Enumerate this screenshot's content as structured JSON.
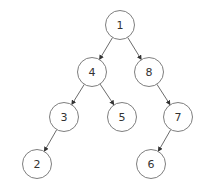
{
  "diagram": {
    "type": "binary-tree",
    "nodes": [
      {
        "id": "1",
        "label": "1",
        "x": 120,
        "y": 25
      },
      {
        "id": "4",
        "label": "4",
        "x": 92,
        "y": 72
      },
      {
        "id": "8",
        "label": "8",
        "x": 149,
        "y": 72
      },
      {
        "id": "3",
        "label": "3",
        "x": 64,
        "y": 117
      },
      {
        "id": "5",
        "label": "5",
        "x": 122,
        "y": 117
      },
      {
        "id": "7",
        "label": "7",
        "x": 178,
        "y": 117
      },
      {
        "id": "2",
        "label": "2",
        "x": 37,
        "y": 164
      },
      {
        "id": "6",
        "label": "6",
        "x": 151,
        "y": 164
      }
    ],
    "edges": [
      {
        "from": "1",
        "to": "4"
      },
      {
        "from": "1",
        "to": "8"
      },
      {
        "from": "4",
        "to": "3"
      },
      {
        "from": "4",
        "to": "5"
      },
      {
        "from": "8",
        "to": "7"
      },
      {
        "from": "3",
        "to": "2"
      },
      {
        "from": "7",
        "to": "6"
      }
    ],
    "node_radius": 14.5,
    "colors": {
      "stroke": "#6f6f6f",
      "edge": "#5a5a5a",
      "text": "#333333",
      "background": "#ffffff"
    }
  }
}
